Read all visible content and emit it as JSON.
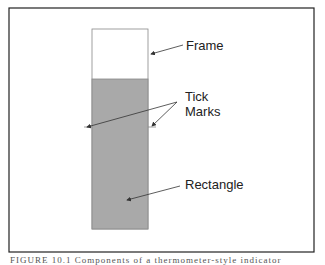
{
  "diagram": {
    "labels": {
      "frame": "Frame",
      "tick_marks_line1": "Tick",
      "tick_marks_line2": "Marks",
      "rectangle": "Rectangle"
    },
    "fill_level": 0.75,
    "colors": {
      "frame_fill": "#ffffff",
      "rectangle_fill": "#a9a9a9",
      "border": "#333333"
    }
  },
  "caption": {
    "text": "FIGURE 10.1  Components of a thermometer-style indicator"
  }
}
